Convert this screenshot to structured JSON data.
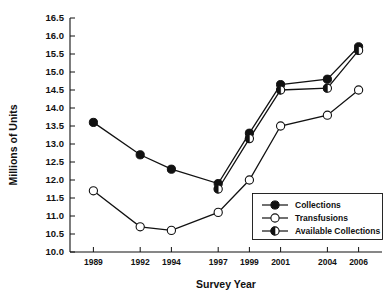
{
  "chart_data": {
    "type": "line",
    "title": "",
    "xlabel": "Survey Year",
    "ylabel": "Millions of Units",
    "x": [
      1989,
      1992,
      1994,
      1997,
      1999,
      2001,
      2004,
      2006
    ],
    "categories": [
      "1989",
      "1992",
      "1994",
      "1997",
      "1999",
      "2001",
      "2004",
      "2006"
    ],
    "xlim": [
      1987.5,
      2007.5
    ],
    "ylim": [
      10.0,
      16.5
    ],
    "ytick_labels": [
      "10.0",
      "10.5",
      "11.0",
      "11.5",
      "12.0",
      "12.5",
      "13.0",
      "13.5",
      "14.0",
      "14.5",
      "15.0",
      "15.5",
      "16.0",
      "16.5"
    ],
    "yticks": [
      10.0,
      10.5,
      11.0,
      11.5,
      12.0,
      12.5,
      13.0,
      13.5,
      14.0,
      14.5,
      15.0,
      15.5,
      16.0,
      16.5
    ],
    "grid": false,
    "legend_position": "lower-right",
    "series": [
      {
        "name": "Collections",
        "marker": "filled-circle",
        "values": [
          13.6,
          12.7,
          12.3,
          11.9,
          13.3,
          14.65,
          14.8,
          15.7
        ]
      },
      {
        "name": "Transfusions",
        "marker": "open-circle",
        "values": [
          11.7,
          10.7,
          10.6,
          11.1,
          12.0,
          13.5,
          13.8,
          14.5
        ]
      },
      {
        "name": "Available Collections",
        "marker": "half-filled-circle",
        "values": [
          null,
          null,
          null,
          11.75,
          13.15,
          14.5,
          14.55,
          15.6
        ]
      }
    ]
  },
  "legend": {
    "items": [
      {
        "label": "Collections",
        "marker": "filled-circle"
      },
      {
        "label": "Transfusions",
        "marker": "open-circle"
      },
      {
        "label": "Available Collections",
        "marker": "half-filled-circle"
      }
    ]
  }
}
